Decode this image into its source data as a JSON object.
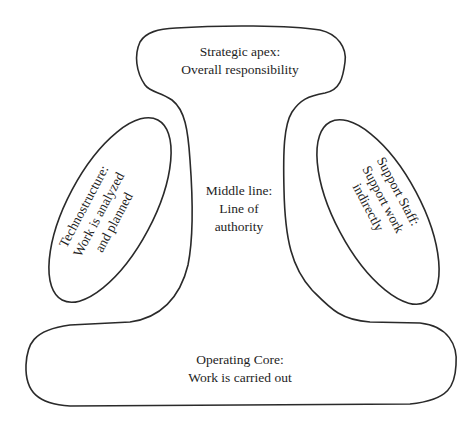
{
  "diagram": {
    "stroke_color": "#2a2a2a",
    "text_color": "#1e1e1e",
    "parts": {
      "strategic_apex": {
        "line1": "Strategic apex:",
        "line2": "Overall responsibility"
      },
      "middle_line": {
        "line1": "Middle line:",
        "line2": "Line of",
        "line3": "authority"
      },
      "technostructure": {
        "line1": "Technostructure:",
        "line2": "Work is analyzed",
        "line3": "and planned"
      },
      "support_staff": {
        "line1": "Support Staff:",
        "line2": "Support work",
        "line3": "indirectly"
      },
      "operating_core": {
        "line1": "Operating Core:",
        "line2": "Work is carried out"
      }
    }
  }
}
